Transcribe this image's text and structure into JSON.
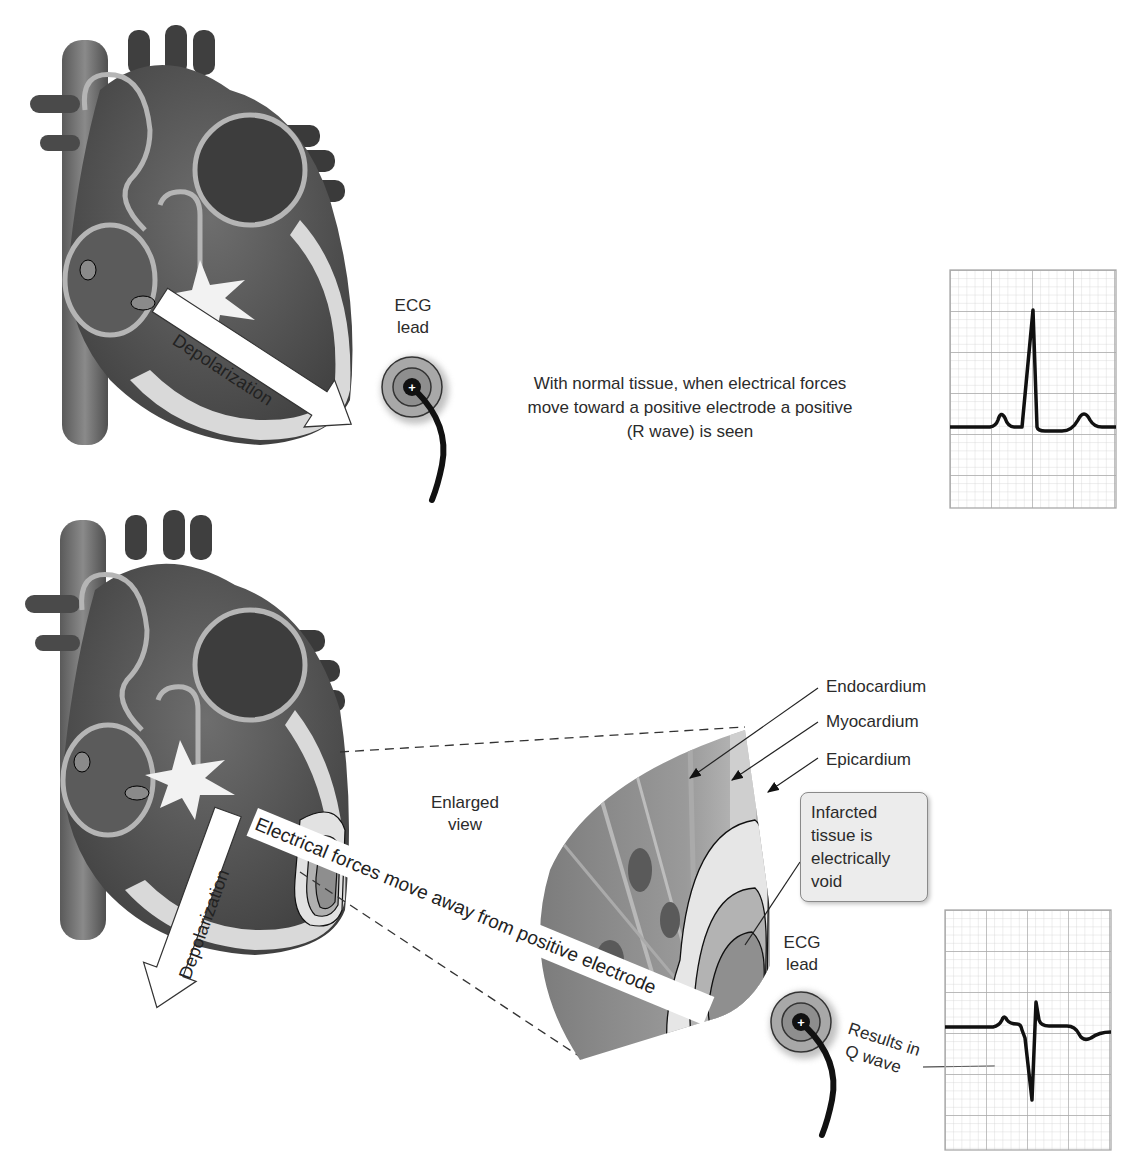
{
  "panels": {
    "top": {
      "arrow_label": "Depolarization",
      "ecg_lead_label_line1": "ECG",
      "ecg_lead_label_line2": "lead",
      "electrode_symbol": "+",
      "caption_line1": "With normal tissue, when electrical forces",
      "caption_line2": "move toward a positive electrode a positive",
      "caption_line3": "(R wave) is seen",
      "ecg_trace": "normal-r-wave"
    },
    "bottom": {
      "arrow_label": "Depolarization",
      "band_label": "Electrical forces move away from positive electrode",
      "enlarged_label_line1": "Enlarged",
      "enlarged_label_line2": "view",
      "layers": [
        "Endocardium",
        "Myocardium",
        "Epicardium"
      ],
      "callout_lines": [
        "Infarcted",
        "tissue is",
        "electrically",
        "void"
      ],
      "ecg_lead_label_line1": "ECG",
      "ecg_lead_label_line2": "lead",
      "electrode_symbol": "+",
      "result_line1": "Results in",
      "result_line2": "Q wave",
      "ecg_trace": "q-wave"
    }
  },
  "colors": {
    "heart_dark": "#4a4a4a",
    "heart_mid": "#7a7a7a",
    "heart_light": "#bdbdbd",
    "tissue_pale": "#e4e4e4",
    "grid_line": "#c8c8c8",
    "trace": "#111111",
    "callout_bg": "#ececec"
  },
  "icons": {
    "electrode": "ecg-electrode-icon",
    "arrow": "depolarization-arrow-icon",
    "spark": "sa-node-spark-icon"
  }
}
